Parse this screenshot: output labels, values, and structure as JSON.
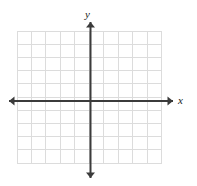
{
  "figure": {
    "type": "coordinate-plane",
    "width": 197,
    "height": 186,
    "background_color": "#ffffff",
    "title": ""
  },
  "axes": {
    "x_label": "x",
    "y_label": "y",
    "axis_color": "#3b3b3b",
    "axis_stroke_width": 2,
    "x_axis": {
      "orientation": "horizontal",
      "y_position": 101,
      "x_start": 9,
      "x_end": 173,
      "arrow_start": true,
      "arrow_end": true
    },
    "y_axis": {
      "orientation": "vertical",
      "x_position": 90.5,
      "y_start": 22,
      "y_end": 178,
      "arrow_start": true,
      "arrow_end": true
    }
  },
  "grid": {
    "color": "#dcdcdc",
    "stroke_width": 1,
    "left": 17,
    "top": 31,
    "right": 161.5,
    "bottom": 163,
    "columns": 10,
    "rows": 10,
    "cell_width": 14.45,
    "cell_height": 13.2,
    "show_grid": true
  },
  "chart_data": {
    "type": "scatter",
    "title": "",
    "xlabel": "x",
    "ylabel": "y",
    "series": [
      {
        "name": "",
        "x": [],
        "y": []
      }
    ],
    "x": [],
    "values": [],
    "categories": [],
    "xlim": [
      -5,
      5
    ],
    "ylim": [
      -5,
      5
    ],
    "xticks": [
      -5,
      -4,
      -3,
      -2,
      -1,
      0,
      1,
      2,
      3,
      4,
      5
    ],
    "yticks": [
      -5,
      -4,
      -3,
      -2,
      -1,
      0,
      1,
      2,
      3,
      4,
      5
    ],
    "xticklabels": [
      "",
      "",
      "",
      "",
      "",
      "",
      "",
      "",
      "",
      "",
      ""
    ],
    "yticklabels": [
      "",
      "",
      "",
      "",
      "",
      "",
      "",
      "",
      "",
      "",
      ""
    ],
    "grid": true,
    "legend": false,
    "legend_position": "none",
    "annotations": []
  }
}
